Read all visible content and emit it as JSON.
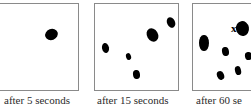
{
  "figure": {
    "background_color": "#ffffff",
    "blob_color": "#000000",
    "panel_border_color": "#8a8a8a",
    "caption_color": "#2b2b2b",
    "panels": [
      {
        "name": "panel-after-5-seconds",
        "caption": "after 5 seconds",
        "caption_left": 4,
        "caption_top": 94,
        "frame": {
          "left": -14,
          "top": 3,
          "width": 93,
          "height": 88
        },
        "x_label": null,
        "blobs": [
          {
            "cx": 64,
            "cy": 30,
            "rx": 6.5,
            "ry": 5.5,
            "rot": -20
          }
        ]
      },
      {
        "name": "panel-after-15-seconds",
        "caption": "after 15 seconds",
        "caption_left": 97,
        "caption_top": 94,
        "frame": {
          "left": 94,
          "top": 3,
          "width": 85,
          "height": 88
        },
        "x_label": null,
        "blobs": [
          {
            "cx": 10,
            "cy": 44,
            "rx": 3.5,
            "ry": 5.0,
            "rot": -12
          },
          {
            "cx": 34,
            "cy": 52,
            "rx": 2.6,
            "ry": 3.4,
            "rot": -15
          },
          {
            "cx": 41,
            "cy": 71,
            "rx": 3.4,
            "ry": 4.6,
            "rot": -8
          },
          {
            "cx": 57,
            "cy": 31,
            "rx": 5.4,
            "ry": 7.0,
            "rot": -30
          },
          {
            "cx": 76,
            "cy": 18,
            "rx": 4.0,
            "ry": 5.4,
            "rot": -25
          }
        ]
      },
      {
        "name": "panel-after-60-seconds",
        "caption": "after 60 se",
        "caption_left": 196,
        "caption_top": 94,
        "frame": {
          "left": 192,
          "top": 3,
          "width": 85,
          "height": 88
        },
        "x_label": "x",
        "x_label_left": 38,
        "x_label_top": 19,
        "blobs": [
          {
            "cx": 11,
            "cy": 39,
            "rx": 4.6,
            "ry": 8.0,
            "rot": 0
          },
          {
            "cx": 50,
            "cy": 25,
            "rx": 6.6,
            "ry": 7.6,
            "rot": -10
          },
          {
            "cx": 32,
            "cy": 48,
            "rx": 3.4,
            "ry": 4.6,
            "rot": -10
          },
          {
            "cx": 56,
            "cy": 52,
            "rx": 3.6,
            "ry": 4.2,
            "rot": -10
          },
          {
            "cx": 27,
            "cy": 71,
            "rx": 3.4,
            "ry": 4.4,
            "rot": -22
          },
          {
            "cx": 45,
            "cy": 66,
            "rx": 3.2,
            "ry": 4.4,
            "rot": -14
          }
        ]
      }
    ]
  }
}
